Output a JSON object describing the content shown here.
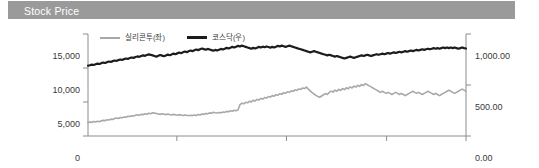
{
  "panel": {
    "title": "Stock Price",
    "header_color": "#9a9a9a",
    "header_text_color": "#ffffff"
  },
  "chart_data": {
    "type": "line",
    "title": "Stock Price",
    "xlabel": "",
    "ylabel": "",
    "grid": false,
    "legend_position": "top-left",
    "x_tick_labels": [
      "2022/12/29",
      "2023/09/20"
    ],
    "x_tick_positions": [
      0.0,
      0.525
    ],
    "x_minor_tick_positions": [
      0.235,
      0.525,
      0.79,
      1.0
    ],
    "axes": {
      "left": {
        "name": "실리콘투(좌)",
        "ticks": [
          "0",
          "5,000",
          "10,000",
          "15,000"
        ],
        "tick_values": [
          0,
          5000,
          10000,
          15000
        ],
        "ylim": [
          0,
          15000
        ],
        "color": "#a8a8a8"
      },
      "right": {
        "name": "코스닥(우)",
        "ticks": [
          "0.00",
          "500.00",
          "1,000.00"
        ],
        "tick_values": [
          0,
          500,
          1000
        ],
        "ylim": [
          0,
          1000
        ],
        "color": "#1c1c1c"
      }
    },
    "legend": [
      {
        "label": "실리콘투(좌)",
        "color": "#a8a8a8",
        "width": 2,
        "axis": "left"
      },
      {
        "label": "코스닥(우)",
        "color": "#1c1c1c",
        "width": 3,
        "axis": "right"
      }
    ],
    "series": [
      {
        "name": "실리콘투(좌)",
        "axis": "left",
        "color": "#a8a8a8",
        "unit": "KRW",
        "values": [
          2000,
          2050,
          1980,
          2120,
          2060,
          2180,
          2100,
          2240,
          2300,
          2260,
          2400,
          2350,
          2480,
          2420,
          2560,
          2640,
          2580,
          2720,
          2680,
          2800,
          2760,
          2900,
          2860,
          2980,
          2940,
          3060,
          3120,
          3040,
          3180,
          3140,
          3260,
          3200,
          3340,
          3280,
          3420,
          3360,
          3300,
          3240,
          3180,
          3260,
          3200,
          3140,
          3220,
          3160,
          3100,
          3180,
          3120,
          3060,
          3140,
          3080,
          3020,
          3100,
          3040,
          2980,
          3060,
          3000,
          3080,
          3020,
          3160,
          3100,
          3240,
          3180,
          3320,
          3260,
          3400,
          3340,
          3480,
          3420,
          3380,
          3460,
          3400,
          3540,
          3480,
          3620,
          3560,
          3700,
          3640,
          3780,
          3720,
          3860,
          4600,
          4820,
          4740,
          4960,
          4880,
          5100,
          5020,
          5240,
          5160,
          5380,
          5300,
          5520,
          5440,
          5660,
          5580,
          5800,
          5720,
          5940,
          5860,
          6080,
          6000,
          6220,
          6140,
          6360,
          6280,
          6500,
          6420,
          6640,
          6560,
          6780,
          6700,
          6920,
          6840,
          7060,
          6980,
          7200,
          6900,
          6620,
          6380,
          6180,
          5980,
          5820,
          5700,
          5880,
          6060,
          6240,
          6100,
          6420,
          6600,
          6460,
          6740,
          6580,
          6860,
          6700,
          6980,
          6820,
          7100,
          6940,
          7220,
          7060,
          7340,
          7180,
          7460,
          7300,
          7580,
          7420,
          7700,
          7540,
          7380,
          7220,
          7060,
          6900,
          6740,
          6580,
          6420,
          6580,
          6420,
          6260,
          6420,
          6260,
          6100,
          6260,
          6420,
          6260,
          6100,
          6260,
          6100,
          5940,
          6100,
          6260,
          6420,
          6580,
          6420,
          6260,
          6420,
          6260,
          6100,
          6260,
          6420,
          6580,
          6420,
          6260,
          6100,
          6260,
          6100,
          5940,
          6100,
          6260,
          6420,
          6580,
          6740,
          6580,
          6420,
          6260,
          6420,
          6580,
          6740,
          6900,
          6740,
          6560
        ]
      },
      {
        "name": "코스닥(우)",
        "axis": "right",
        "color": "#1c1c1c",
        "unit": "pt",
        "values": [
          690,
          694,
          700,
          696,
          704,
          710,
          706,
          714,
          720,
          716,
          724,
          730,
          726,
          734,
          740,
          736,
          744,
          750,
          746,
          754,
          760,
          756,
          764,
          770,
          766,
          774,
          780,
          776,
          784,
          790,
          786,
          794,
          800,
          796,
          790,
          784,
          778,
          786,
          794,
          788,
          782,
          790,
          798,
          792,
          800,
          808,
          802,
          810,
          818,
          812,
          820,
          828,
          822,
          830,
          838,
          832,
          840,
          848,
          842,
          850,
          858,
          852,
          846,
          854,
          848,
          842,
          836,
          844,
          838,
          846,
          854,
          848,
          856,
          864,
          858,
          866,
          874,
          868,
          876,
          884,
          878,
          886,
          880,
          874,
          868,
          862,
          856,
          864,
          858,
          866,
          874,
          868,
          876,
          870,
          878,
          872,
          866,
          874,
          868,
          876,
          884,
          878,
          886,
          880,
          874,
          880,
          886,
          880,
          874,
          868,
          862,
          856,
          850,
          844,
          838,
          832,
          826,
          820,
          826,
          832,
          826,
          820,
          814,
          808,
          802,
          796,
          790,
          796,
          790,
          784,
          778,
          784,
          778,
          772,
          766,
          760,
          766,
          772,
          778,
          772,
          766,
          772,
          778,
          784,
          790,
          784,
          790,
          796,
          790,
          784,
          790,
          796,
          802,
          796,
          802,
          808,
          802,
          808,
          814,
          808,
          814,
          820,
          814,
          820,
          826,
          820,
          826,
          832,
          826,
          832,
          838,
          832,
          838,
          844,
          838,
          844,
          850,
          844,
          850,
          856,
          850,
          856,
          862,
          856,
          862,
          856,
          862,
          868,
          862,
          868,
          862,
          868,
          862,
          868,
          862,
          856,
          862,
          868,
          862,
          858
        ]
      }
    ]
  }
}
